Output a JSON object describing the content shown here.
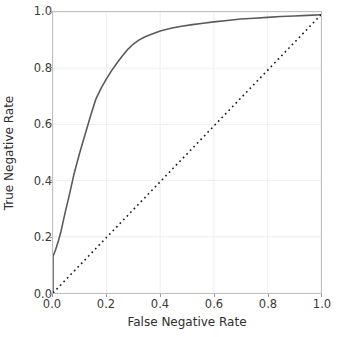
{
  "chart_data": {
    "type": "line",
    "title": "",
    "xlabel": "False Negative Rate",
    "ylabel": "True Negative Rate",
    "xlim": [
      0.0,
      1.0
    ],
    "ylim": [
      0.0,
      1.0
    ],
    "xticks": [
      "0.0",
      "0.2",
      "0.4",
      "0.6",
      "0.8",
      "1.0"
    ],
    "xtick_values": [
      0.0,
      0.2,
      0.4,
      0.6,
      0.8,
      1.0
    ],
    "yticks": [
      "0.0",
      "0.2",
      "0.4",
      "0.6",
      "0.8",
      "1.0"
    ],
    "ytick_values": [
      0.0,
      0.2,
      0.4,
      0.6,
      0.8,
      1.0
    ],
    "grid": true,
    "grid_color": "#eeeeee",
    "legend": null,
    "legend_position": "none",
    "series": [
      {
        "name": "roc-curve",
        "style": "solid",
        "color": "#5a5a5a",
        "linewidth": 1.6,
        "x": [
          0.0,
          0.0,
          0.01,
          0.02,
          0.03,
          0.045,
          0.06,
          0.08,
          0.1,
          0.12,
          0.14,
          0.16,
          0.18,
          0.2,
          0.22,
          0.24,
          0.26,
          0.28,
          0.3,
          0.32,
          0.34,
          0.36,
          0.38,
          0.4,
          0.44,
          0.48,
          0.52,
          0.56,
          0.6,
          0.65,
          0.7,
          0.75,
          0.8,
          0.85,
          0.9,
          0.95,
          1.0
        ],
        "y": [
          0.0,
          0.13,
          0.155,
          0.185,
          0.22,
          0.285,
          0.345,
          0.43,
          0.5,
          0.565,
          0.63,
          0.69,
          0.73,
          0.763,
          0.793,
          0.82,
          0.845,
          0.868,
          0.886,
          0.9,
          0.91,
          0.918,
          0.925,
          0.932,
          0.942,
          0.949,
          0.955,
          0.96,
          0.965,
          0.97,
          0.975,
          0.978,
          0.981,
          0.984,
          0.986,
          0.988,
          0.99
        ]
      },
      {
        "name": "chance-diagonal",
        "style": "dotted",
        "color": "#1a1a1a",
        "linewidth": 1.6,
        "x": [
          0.0,
          1.0
        ],
        "y": [
          0.0,
          0.99
        ]
      }
    ]
  },
  "axes": {
    "spine_color": "#bfbfbf",
    "tick_color": "#9a9a9a",
    "label_color": "#2e2e2e",
    "background": "#ffffff"
  }
}
